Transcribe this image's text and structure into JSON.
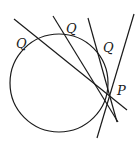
{
  "diagram": {
    "stroke_color": "#1a1a1a",
    "labels": {
      "q1": "Q",
      "q2": "Q",
      "q3": "Q",
      "p": "P"
    }
  }
}
